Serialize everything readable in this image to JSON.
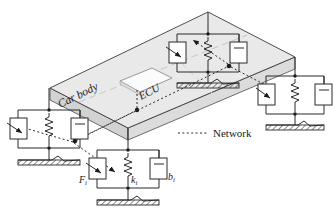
{
  "figure": {
    "type": "schematic-diagram",
    "background_color": "#ffffff",
    "line_color": "#1a1a1a",
    "body_fill": "#e8e8e8",
    "body_edge_fill": "#d2d2d2",
    "ecu_fill": "#fbfbfb",
    "network_color": "#4a4a4a"
  },
  "labels": {
    "car_body": "Car body",
    "ecu": "ECU",
    "legend_network": "Network",
    "force": "F",
    "force_sub": "i",
    "spring": "k",
    "spring_sub": "i",
    "damper": "b",
    "damper_sub": "i"
  },
  "car_body": {
    "name": "car-body-plate",
    "top_face": "50,88 208,12 295,57 128,128",
    "thickness_px": 12
  },
  "ecu": {
    "name": "ecu-module",
    "polygon": "120,81 152,68 172,78 140,92",
    "node": {
      "x": 137,
      "y": 111
    }
  },
  "network": {
    "hub_nodes": [
      {
        "name": "network-node-center-left",
        "x": 75,
        "y": 141
      },
      {
        "name": "network-node-center-right",
        "x": 229,
        "y": 66
      }
    ],
    "links": [
      {
        "from": "ecu",
        "to": "hub-left"
      },
      {
        "from": "hub-left",
        "to": "suspension-front-left"
      },
      {
        "from": "hub-left",
        "to": "suspension-front-right"
      },
      {
        "from": "hub-left",
        "to": "hub-right"
      },
      {
        "from": "hub-right",
        "to": "suspension-rear-left"
      },
      {
        "from": "hub-right",
        "to": "suspension-rear-right"
      }
    ]
  },
  "suspensions": [
    {
      "id": "front-left",
      "name": "suspension-front-left",
      "cx": 49,
      "top": 97,
      "ground_y": 160,
      "labeled": false,
      "components": [
        "actuator",
        "spring",
        "damper"
      ]
    },
    {
      "id": "front-right",
      "name": "suspension-front-right",
      "cx": 128,
      "top": 137,
      "ground_y": 200,
      "labeled": true,
      "components": [
        "actuator",
        "spring",
        "damper"
      ]
    },
    {
      "id": "rear-left",
      "name": "suspension-rear-left",
      "cx": 208,
      "top": 22,
      "ground_y": 83,
      "labeled": false,
      "components": [
        "actuator",
        "spring",
        "damper"
      ]
    },
    {
      "id": "rear-right",
      "name": "suspension-rear-right",
      "cx": 295,
      "top": 63,
      "ground_y": 125,
      "labeled": false,
      "components": [
        "actuator",
        "spring",
        "damper"
      ]
    }
  ],
  "legend": {
    "name": "legend-network",
    "line_x1": 178,
    "line_x2": 208,
    "y": 133,
    "text_x": 213
  }
}
